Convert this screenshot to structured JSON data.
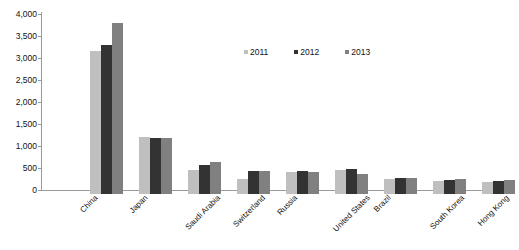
{
  "chart_data": {
    "type": "bar",
    "title": "",
    "subtitle": "",
    "xlabel": "",
    "ylabel": "",
    "ylim": [
      0,
      4000
    ],
    "yticks": [
      "0",
      "500",
      "1,000",
      "1,500",
      "2,000",
      "2,500",
      "3,000",
      "3,500",
      "4,000"
    ],
    "ytick_values": [
      0,
      500,
      1000,
      1500,
      2000,
      2500,
      3000,
      3500,
      4000
    ],
    "grid": false,
    "legend_position": "top-center",
    "categories": [
      "China",
      "Japan",
      "Saudi Arabia",
      "Switzerland",
      "Russia",
      "United States",
      "Brazil",
      "South Korea",
      "Hong Kong"
    ],
    "series": [
      {
        "name": "2011",
        "color": "#bfbfbf",
        "values": [
          3240,
          1290,
          540,
          330,
          500,
          540,
          350,
          300,
          280
        ]
      },
      {
        "name": "2012",
        "color": "#333333",
        "values": [
          3390,
          1270,
          650,
          530,
          530,
          570,
          370,
          320,
          300
        ]
      },
      {
        "name": "2013",
        "color": "#808080",
        "values": [
          3880,
          1270,
          720,
          530,
          510,
          450,
          360,
          340,
          310
        ]
      }
    ]
  },
  "axis": {
    "y_tick_labels": [
      "4,000",
      "3,500",
      "3,000",
      "2,500",
      "2,000",
      "1,500",
      "1,000",
      "500",
      "0"
    ]
  },
  "legend": {
    "items": [
      {
        "label": "2011"
      },
      {
        "label": "2012"
      },
      {
        "label": "2013"
      }
    ]
  }
}
